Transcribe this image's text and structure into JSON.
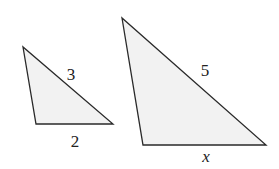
{
  "figure": {
    "fill_color": "#f2f2f2",
    "stroke_color": "#2a2a2a",
    "small_triangle": {
      "vertices": [
        [
          23,
          47
        ],
        [
          36,
          124
        ],
        [
          113,
          124
        ]
      ],
      "labels": {
        "hypotenuse": "3",
        "base": "2"
      }
    },
    "large_triangle": {
      "vertices": [
        [
          122,
          18
        ],
        [
          143,
          145
        ],
        [
          266,
          145
        ]
      ],
      "labels": {
        "hypotenuse": "5",
        "base": "x"
      }
    }
  }
}
